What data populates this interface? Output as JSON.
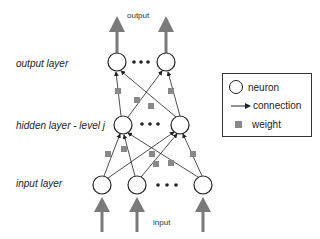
{
  "diagram": {
    "type": "neural-network",
    "top_label": "output",
    "bottom_label": "input",
    "layers": [
      {
        "id": "output",
        "label": "output layer",
        "neurons": 2,
        "ellipsis": true
      },
      {
        "id": "hidden",
        "label": "hidden layer - level j",
        "neurons": 2,
        "ellipsis": true
      },
      {
        "id": "input",
        "label": "input layer",
        "neurons": 3,
        "ellipsis": true
      }
    ],
    "ellipsis_glyph": "• • •"
  },
  "legend": {
    "items": [
      {
        "icon": "circle-icon",
        "label": "neuron"
      },
      {
        "icon": "arrow-right-icon",
        "label": "connection"
      },
      {
        "icon": "square-icon",
        "label": "weight"
      }
    ]
  },
  "colors": {
    "stroke": "#222222",
    "weight": "#888888",
    "io_arrow": "#7a7a7a"
  }
}
